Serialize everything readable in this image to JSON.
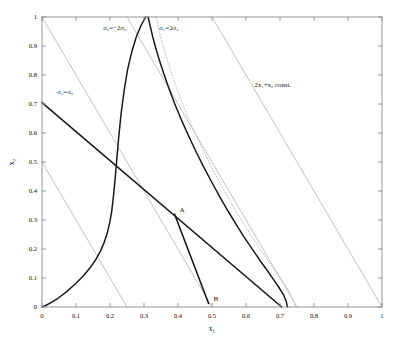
{
  "figure": {
    "background": "#ffffff",
    "axes_color": "#8c8c8c",
    "curve_color": "#1a1a1a",
    "family_color": "#b3b3b3",
    "dotted_color": "#bdbdbd"
  },
  "axis": {
    "xlabel": "x₁",
    "ylabel": "x₂",
    "xlim": [
      0,
      1
    ],
    "ylim": [
      0,
      1
    ],
    "xticks": [
      "0",
      "0.1",
      "0.2",
      "0.3",
      "0.4",
      "0.5",
      "0.6",
      "0.7",
      "0.8",
      "0.9",
      "1"
    ],
    "yticks": [
      "0",
      "0.1",
      "0.2",
      "0.3",
      "0.4",
      "0.5",
      "0.6",
      "0.7",
      "0.8",
      "0.9",
      "1"
    ],
    "tick_values": [
      0,
      0.1,
      0.2,
      0.3,
      0.4,
      0.5,
      0.6,
      0.7,
      0.8,
      0.9,
      1.0
    ]
  },
  "annotations": {
    "sigma3": "σ₃=−2σ₀",
    "sigma1": "σ₁=2σ₀",
    "sigma2": "σ₂=σ₀",
    "family": "2x₁+x₂ const.",
    "point_a": "A",
    "point_b": "B"
  },
  "chart_data": {
    "type": "line",
    "title": "",
    "xlabel": "x₁",
    "ylabel": "x₂",
    "xlim": [
      0,
      1
    ],
    "ylim": [
      0,
      1
    ],
    "grid": false,
    "legend": "none",
    "annotations": [
      {
        "text": "σ₃=−2σ₀",
        "x": 0.18,
        "y": 0.955
      },
      {
        "text": "σ₁=2σ₀",
        "x": 0.345,
        "y": 0.955
      },
      {
        "text": "σ₂=σ₀",
        "x": 0.045,
        "y": 0.735
      },
      {
        "text": "2x₁+x₂ const.",
        "x": 0.625,
        "y": 0.76
      }
    ],
    "points": [
      {
        "label": "A",
        "x": 0.39,
        "y": 0.32
      },
      {
        "label": "B",
        "x": 0.49,
        "y": 0.012
      }
    ],
    "series": [
      {
        "name": "σ₃=−2σ₀",
        "style": "solid",
        "color": "#1a1a1a",
        "width": 1.5,
        "x": [
          0.0,
          0.012,
          0.028,
          0.048,
          0.072,
          0.1,
          0.122,
          0.142,
          0.158,
          0.172,
          0.183,
          0.192,
          0.199,
          0.205,
          0.21,
          0.215,
          0.22,
          0.226,
          0.233,
          0.242,
          0.252,
          0.264,
          0.277,
          0.291,
          0.305
        ],
        "y": [
          0.0,
          0.006,
          0.016,
          0.031,
          0.052,
          0.082,
          0.108,
          0.136,
          0.163,
          0.193,
          0.223,
          0.255,
          0.29,
          0.33,
          0.38,
          0.44,
          0.51,
          0.59,
          0.67,
          0.75,
          0.82,
          0.88,
          0.93,
          0.97,
          1.0
        ]
      },
      {
        "name": "σ₁=2σ₀",
        "style": "solid",
        "color": "#1a1a1a",
        "width": 1.5,
        "x": [
          0.312,
          0.318,
          0.325,
          0.334,
          0.345,
          0.358,
          0.373,
          0.39,
          0.409,
          0.43,
          0.452,
          0.475,
          0.499,
          0.523,
          0.547,
          0.571,
          0.594,
          0.617,
          0.639,
          0.66,
          0.679,
          0.696,
          0.71,
          0.718,
          0.722
        ],
        "y": [
          1.0,
          0.97,
          0.935,
          0.895,
          0.852,
          0.805,
          0.755,
          0.702,
          0.648,
          0.593,
          0.538,
          0.484,
          0.431,
          0.38,
          0.331,
          0.285,
          0.242,
          0.202,
          0.164,
          0.13,
          0.098,
          0.069,
          0.043,
          0.02,
          0.0
        ]
      },
      {
        "name": "σ₁=2σ₀ dotted",
        "style": "dotted",
        "color": "#bdbdbd",
        "width": 1.0,
        "x": [
          0.335,
          0.341,
          0.348,
          0.357,
          0.368,
          0.381,
          0.396,
          0.413,
          0.432,
          0.453,
          0.475,
          0.498,
          0.522,
          0.546,
          0.57,
          0.594,
          0.617,
          0.64,
          0.662,
          0.683,
          0.702,
          0.719,
          0.733,
          0.741,
          0.745
        ],
        "y": [
          1.0,
          0.97,
          0.935,
          0.895,
          0.852,
          0.805,
          0.755,
          0.702,
          0.648,
          0.593,
          0.538,
          0.484,
          0.431,
          0.38,
          0.331,
          0.285,
          0.242,
          0.202,
          0.164,
          0.13,
          0.098,
          0.069,
          0.043,
          0.02,
          0.0
        ]
      },
      {
        "name": "σ₂=σ₀",
        "style": "solid",
        "color": "#1a1a1a",
        "width": 1.6,
        "x": [
          0.0,
          0.705
        ],
        "y": [
          0.705,
          0.0
        ]
      },
      {
        "name": "feasible-boundary-AB",
        "style": "solid",
        "color": "#1a1a1a",
        "width": 1.6,
        "x": [
          0.39,
          0.49
        ],
        "y": [
          0.32,
          0.012
        ]
      }
    ],
    "family_lines": {
      "name": "2x₁+x₂ const.",
      "color": "#b3b3b3",
      "width": 0.8,
      "slope": -2,
      "constants": [
        0.5,
        1.0,
        1.5,
        2.0
      ]
    }
  }
}
